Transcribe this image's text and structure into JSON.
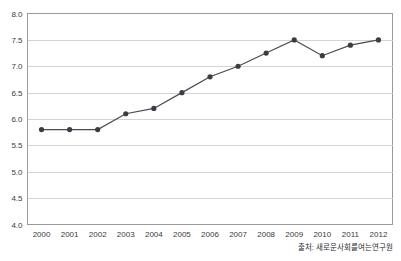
{
  "chart_data": {
    "type": "line",
    "title": "",
    "subtitle": "",
    "xlabel": "",
    "ylabel": "",
    "categories": [
      "2000",
      "2001",
      "2002",
      "2003",
      "2004",
      "2005",
      "2006",
      "2007",
      "2008",
      "2009",
      "2010",
      "2011",
      "2012"
    ],
    "x": [
      2000,
      2001,
      2002,
      2003,
      2004,
      2005,
      2006,
      2007,
      2008,
      2009,
      2010,
      2011,
      2012
    ],
    "values": [
      5.8,
      5.8,
      5.8,
      6.1,
      6.2,
      6.5,
      6.8,
      7.0,
      7.25,
      7.5,
      7.2,
      7.4,
      7.5
    ],
    "series": [
      {
        "name": "series-1",
        "values": [
          5.8,
          5.8,
          5.8,
          6.1,
          6.2,
          6.5,
          6.8,
          7.0,
          7.25,
          7.5,
          7.2,
          7.4,
          7.5
        ]
      }
    ],
    "ylim": [
      4.0,
      8.0
    ],
    "y_ticks": [
      "4.0",
      "4.5",
      "5.0",
      "5.5",
      "6.0",
      "6.5",
      "7.0",
      "7.5",
      "8.0"
    ],
    "y_tick_values": [
      4.0,
      4.5,
      5.0,
      5.5,
      6.0,
      6.5,
      7.0,
      7.5,
      8.0
    ],
    "grid": true,
    "legend": false,
    "legend_position": "none",
    "marker": "circle",
    "line_color": "#4a4a52",
    "marker_color": "#3c3c44",
    "grid_color": "#d4d4d4",
    "border_color": "#9a9a9a",
    "background_color": "#ffffff",
    "annotations": []
  },
  "footer": {
    "source_note": "출처: 새로운사회를여는연구원"
  }
}
